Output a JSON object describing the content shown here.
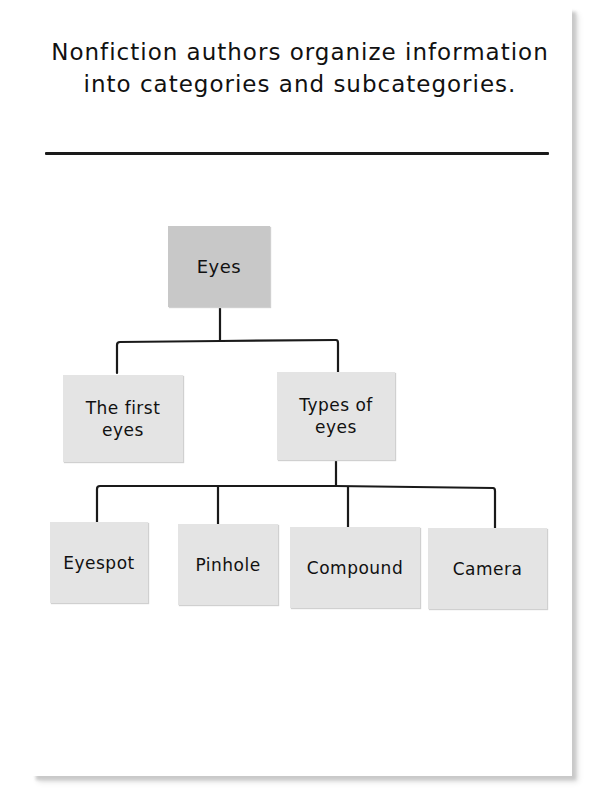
{
  "header": {
    "title": "Nonfiction authors organize information into categories and subcategories."
  },
  "diagram": {
    "type": "tree",
    "root": {
      "id": "eyes",
      "label": "Eyes",
      "color": "#c8c8c8"
    },
    "level1": [
      {
        "id": "first-eyes",
        "label": "The first eyes",
        "color": "#e4e4e4"
      },
      {
        "id": "types-of-eyes",
        "label": "Types of eyes",
        "color": "#e4e4e4"
      }
    ],
    "level2_parent": "types-of-eyes",
    "level2": [
      {
        "id": "eyespot",
        "label": "Eyespot",
        "color": "#e4e4e4"
      },
      {
        "id": "pinhole",
        "label": "Pinhole",
        "color": "#e4e4e4"
      },
      {
        "id": "compound",
        "label": "Compound",
        "color": "#e4e4e4"
      },
      {
        "id": "camera",
        "label": "Camera",
        "color": "#e4e4e4"
      }
    ],
    "line_color": "#1a1a1a"
  }
}
